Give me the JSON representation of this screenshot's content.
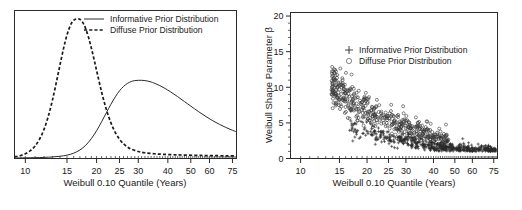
{
  "figure": {
    "panels": [
      {
        "id": "prior-density-panel",
        "xlabel": "Weibull 0.10 Quantile (Years)",
        "legend": [
          {
            "label": "Informative Prior Distribution",
            "marker": "solid-line"
          },
          {
            "label": "Diffuse Prior Distribution",
            "marker": "dashed-line"
          }
        ]
      },
      {
        "id": "posterior-scatter-panel",
        "xlabel": "Weibull 0.10 Quantile (Years)",
        "ylabel": "Weibull Shape Parameter β",
        "legend": [
          {
            "label": "Informative Prior Distribution",
            "marker": "plus"
          },
          {
            "label": "Diffuse Prior Distribution",
            "marker": "circle"
          }
        ]
      }
    ]
  },
  "chart_data": [
    {
      "type": "line",
      "title": "",
      "xlabel": "Weibull 0.10 Quantile (Years)",
      "ylabel": "",
      "xscale": "log",
      "xlim": [
        9,
        78
      ],
      "ylim": [
        0,
        1.06
      ],
      "xticks": [
        10,
        15,
        20,
        25,
        30,
        40,
        50,
        60,
        75
      ],
      "xticklabels": [
        "10",
        "15",
        "20",
        "25",
        "30",
        "40",
        "50",
        "60",
        "75"
      ],
      "yticks": [],
      "grid": false,
      "legend_position": "top-center",
      "series": [
        {
          "name": "Informative Prior Distribution",
          "style": "solid",
          "peak_x": 31.5,
          "peak_y": 0.56,
          "x": [
            9,
            10,
            11,
            12,
            13,
            14,
            15,
            16,
            17,
            18,
            19,
            20,
            21,
            22,
            23,
            24,
            25,
            26,
            27,
            28,
            29,
            30,
            31,
            32,
            33,
            34,
            35,
            37,
            39,
            41,
            44,
            47,
            50,
            54,
            58,
            62,
            66,
            70,
            74,
            78
          ],
          "y": [
            0.004,
            0.005,
            0.006,
            0.008,
            0.011,
            0.016,
            0.024,
            0.038,
            0.061,
            0.095,
            0.142,
            0.199,
            0.263,
            0.328,
            0.389,
            0.442,
            0.485,
            0.516,
            0.538,
            0.551,
            0.558,
            0.56,
            0.56,
            0.558,
            0.554,
            0.548,
            0.54,
            0.522,
            0.501,
            0.478,
            0.443,
            0.408,
            0.375,
            0.335,
            0.3,
            0.27,
            0.245,
            0.224,
            0.206,
            0.191
          ]
        },
        {
          "name": "Diffuse Prior Distribution",
          "style": "dashed",
          "peak_x": 17.0,
          "peak_y": 1.0,
          "x": [
            9,
            9.5,
            10,
            10.5,
            11,
            11.5,
            12,
            12.5,
            13,
            13.5,
            14,
            14.5,
            15,
            15.5,
            16,
            16.5,
            17,
            17.5,
            18,
            18.5,
            19,
            19.5,
            20,
            21,
            22,
            23,
            24,
            25,
            26,
            27,
            28,
            30,
            32,
            35,
            38,
            42,
            46,
            52,
            58,
            65,
            72,
            78
          ],
          "y": [
            0.012,
            0.02,
            0.034,
            0.056,
            0.09,
            0.14,
            0.21,
            0.302,
            0.414,
            0.54,
            0.668,
            0.788,
            0.885,
            0.953,
            0.99,
            1.0,
            0.997,
            0.973,
            0.928,
            0.866,
            0.792,
            0.712,
            0.63,
            0.476,
            0.35,
            0.255,
            0.186,
            0.138,
            0.105,
            0.082,
            0.067,
            0.05,
            0.041,
            0.034,
            0.03,
            0.027,
            0.025,
            0.023,
            0.021,
            0.02,
            0.019,
            0.019
          ]
        }
      ]
    },
    {
      "type": "scatter",
      "title": "",
      "xlabel": "Weibull 0.10 Quantile (Years)",
      "ylabel": "Weibull Shape Parameter β",
      "xscale": "log",
      "xlim": [
        9,
        78
      ],
      "ylim": [
        0,
        20.5
      ],
      "xticks": [
        10,
        15,
        20,
        25,
        30,
        40,
        50,
        60,
        75
      ],
      "xticklabels": [
        "10",
        "15",
        "20",
        "25",
        "30",
        "40",
        "50",
        "60",
        "75"
      ],
      "yticks": [
        0,
        5,
        10,
        15,
        20
      ],
      "yticklabels": [
        "0",
        "5",
        "10",
        "15",
        "20"
      ],
      "grid": false,
      "legend_position": "upper-center",
      "relationship": "inverse hyperbolic: beta decreases as quantile increases",
      "series": [
        {
          "name": "Informative Prior Distribution",
          "marker": "plus",
          "n_points": 520,
          "x_range": [
            16,
            77
          ],
          "y_range": [
            1.2,
            7.5
          ],
          "cluster_center": [
            34,
            2.6
          ]
        },
        {
          "name": "Diffuse Prior Distribution",
          "marker": "circle",
          "n_points": 470,
          "x_range": [
            13.6,
            47
          ],
          "y_range": [
            1.8,
            18.2
          ],
          "cluster_center": [
            16.5,
            9.5
          ]
        }
      ]
    }
  ]
}
